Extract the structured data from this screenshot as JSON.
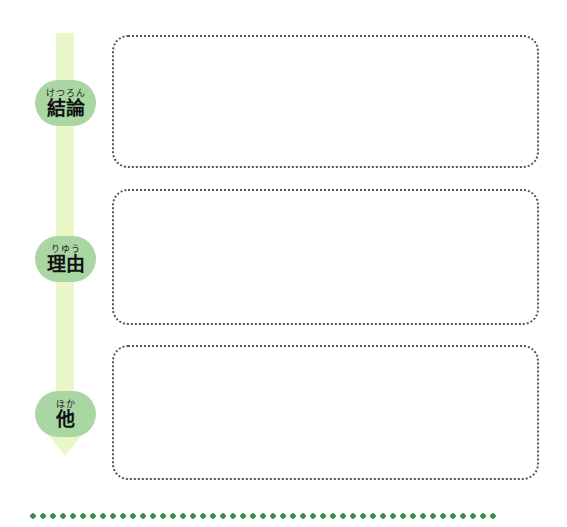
{
  "flow": {
    "steps": [
      {
        "ruby": "けつろん",
        "label": "結論"
      },
      {
        "ruby": "りゆう",
        "label": "理由"
      },
      {
        "ruby": "ほか",
        "label": "他"
      }
    ]
  },
  "colors": {
    "arrow": "#eaf7c8",
    "pill": "#a9d6a3",
    "divider_dots": "#3a8f4f",
    "box_border": "#555555"
  },
  "boxes": [
    {
      "content": ""
    },
    {
      "content": ""
    },
    {
      "content": ""
    }
  ]
}
